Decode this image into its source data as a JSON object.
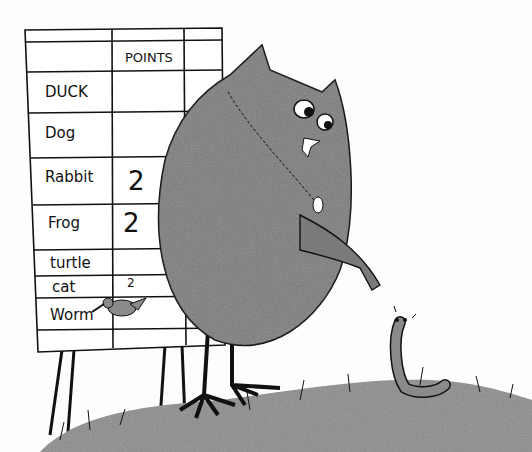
{
  "scoreboard": {
    "header": "POINTS",
    "rows": [
      {
        "name": "DUCK",
        "points": ""
      },
      {
        "name": "Dog",
        "points": ""
      },
      {
        "name": "Rabbit",
        "points": "2"
      },
      {
        "name": "Frog",
        "points": "2"
      },
      {
        "name": "turtle",
        "points": ""
      },
      {
        "name": "cat",
        "points": "2"
      },
      {
        "name": "Worm",
        "points": ""
      }
    ]
  },
  "colors": {
    "owl": "#7a7a7a",
    "grass": "#8a8a8a",
    "ink": "#111111",
    "paper": "#fdfdfb"
  }
}
